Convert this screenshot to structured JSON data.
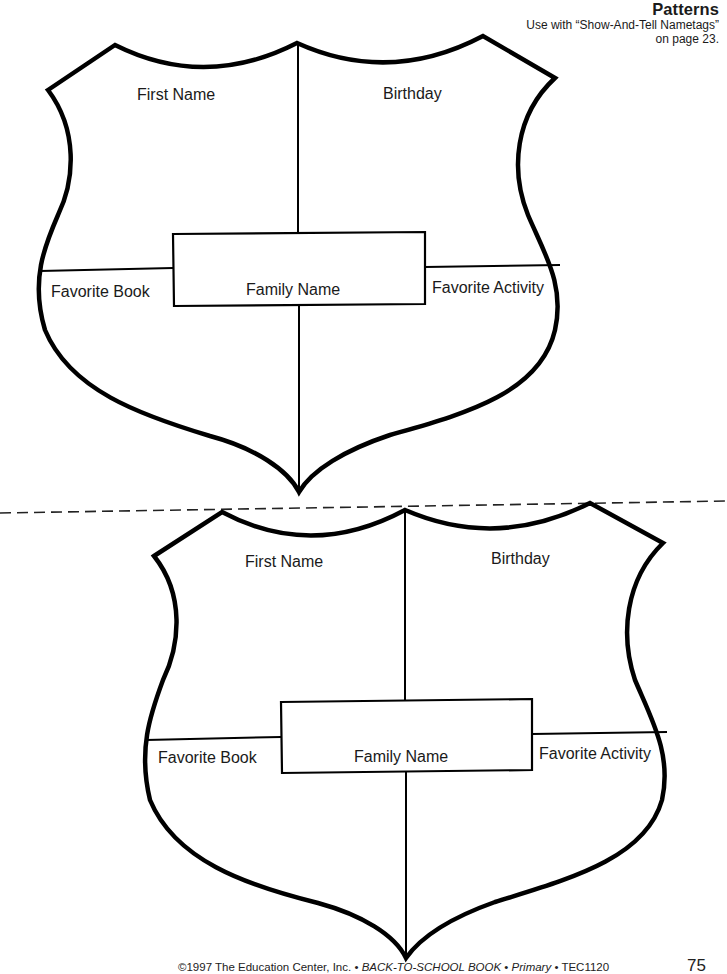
{
  "header": {
    "title": "Patterns",
    "line1": "Use with “Show-And-Tell Nametags”",
    "line2": "on page 23."
  },
  "shields": [
    {
      "fields": {
        "first_name": "First Name",
        "birthday": "Birthday",
        "family_name": "Family Name",
        "favorite_book": "Favorite Book",
        "favorite_activity": "Favorite Activity"
      }
    },
    {
      "fields": {
        "first_name": "First Name",
        "birthday": "Birthday",
        "family_name": "Family Name",
        "favorite_book": "Favorite Book",
        "favorite_activity": "Favorite Activity"
      }
    }
  ],
  "footer": {
    "copyright": "©1997 The Education Center, Inc. • ",
    "book_title": "BACK-TO-SCHOOL BOOK",
    "sep1": " • ",
    "level": "Primary",
    "sep2": " • TEC1120",
    "page_number": "75"
  },
  "colors": {
    "ink": "#000000",
    "paper": "#ffffff"
  }
}
